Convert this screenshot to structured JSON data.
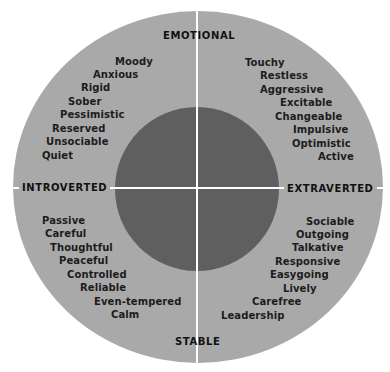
{
  "colors": {
    "background": "#ffffff",
    "outer_circle": "#a9a9a9",
    "inner_circle": "#5f5f5f",
    "axis_lines": "#ffffff",
    "text": "#1c1c1c"
  },
  "axes": {
    "top": "EMOTIONAL",
    "bottom": "STABLE",
    "left": "INTROVERTED",
    "right": "EXTRAVERTED"
  },
  "quadrants": {
    "emotional_introverted": [
      "Moody",
      "Anxious",
      "Rigid",
      "Sober",
      "Pessimistic",
      "Reserved",
      "Unsociable",
      "Quiet"
    ],
    "emotional_extraverted": [
      "Touchy",
      "Restless",
      "Aggressive",
      "Excitable",
      "Changeable",
      "Impulsive",
      "Optimistic",
      "Active"
    ],
    "stable_introverted": [
      "Passive",
      "Careful",
      "Thoughtful",
      "Peaceful",
      "Controlled",
      "Reliable",
      "Even-tempered",
      "Calm"
    ],
    "stable_extraverted": [
      "Sociable",
      "Outgoing",
      "Talkative",
      "Responsive",
      "Easygoing",
      "Lively",
      "Carefree",
      "Leadership"
    ]
  }
}
